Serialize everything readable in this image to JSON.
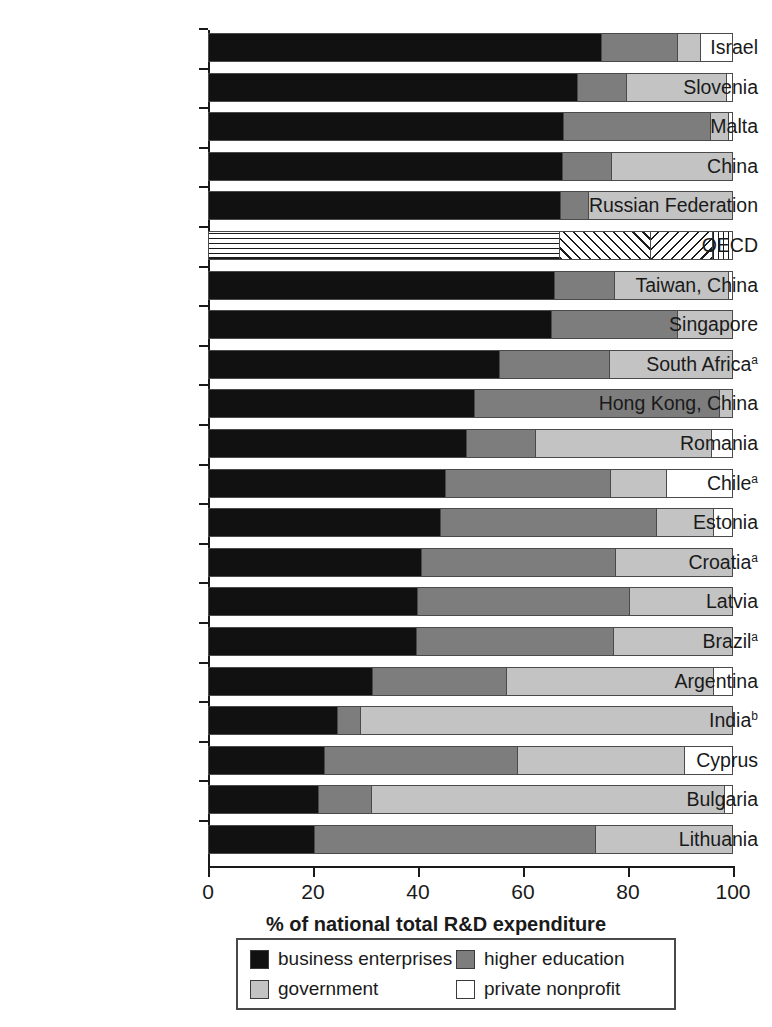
{
  "chart_data": {
    "type": "bar",
    "orientation": "horizontal",
    "stacked": true,
    "title": "",
    "xlabel": "% of national total R&D expenditure",
    "ylabel": "",
    "xlim": [
      0,
      100
    ],
    "xticks": [
      "0",
      "20",
      "40",
      "60",
      "80",
      "100"
    ],
    "grid": false,
    "legend_position": "bottom",
    "categories": [
      "Israel",
      "Slovenia",
      "Malta",
      "China",
      "Russian Federation",
      "OECD",
      "Taiwan, China",
      "Singapore",
      "South Africa",
      "Hong Kong, China",
      "Romania",
      "Chile",
      "Estonia",
      "Croatia",
      "Latvia",
      "Brazil",
      "Argentina",
      "India",
      "Cyprus",
      "Bulgaria",
      "Lithuania"
    ],
    "category_footnotes": [
      "",
      "",
      "",
      "",
      "",
      "",
      "",
      "",
      "a",
      "",
      "",
      "a",
      "",
      "a",
      "",
      "a",
      "",
      "b",
      "",
      "",
      ""
    ],
    "series": [
      {
        "name": "business enterprises",
        "color": "#111111",
        "values": [
          75.0,
          70.3,
          67.7,
          67.5,
          67.2,
          66.9,
          65.9,
          65.4,
          55.4,
          50.7,
          49.1,
          45.2,
          44.2,
          40.6,
          39.8,
          39.6,
          31.1,
          24.4,
          21.9,
          20.8,
          20.0
        ]
      },
      {
        "name": "higher education",
        "color": "#7d7d7d",
        "values": [
          14.4,
          9.4,
          28.0,
          9.3,
          5.2,
          17.4,
          11.5,
          24.0,
          21.0,
          46.9,
          13.3,
          31.4,
          41.2,
          37.0,
          40.6,
          37.6,
          25.6,
          4.4,
          37.0,
          10.1,
          53.8
        ]
      },
      {
        "name": "government",
        "color": "#c3c3c3",
        "values": [
          4.4,
          19.2,
          3.5,
          23.2,
          27.6,
          11.9,
          21.8,
          10.6,
          23.6,
          2.4,
          33.6,
          10.7,
          11.0,
          22.4,
          19.6,
          22.8,
          39.6,
          71.2,
          32.0,
          67.6,
          26.2
        ]
      },
      {
        "name": "private nonprofit",
        "color": "#ffffff",
        "values": [
          6.2,
          1.1,
          0.8,
          0.0,
          0.0,
          3.8,
          0.8,
          0.0,
          0.0,
          0.0,
          4.0,
          12.7,
          3.6,
          0.0,
          0.0,
          0.0,
          3.7,
          0.0,
          9.1,
          1.5,
          0.0
        ]
      }
    ],
    "hatched_rows": [
      5
    ]
  },
  "legend": {
    "items": [
      {
        "label": "business enterprises",
        "swatch": "sw-business"
      },
      {
        "label": "higher education",
        "swatch": "sw-higher"
      },
      {
        "label": "government",
        "swatch": "sw-government"
      },
      {
        "label": "private nonprofit",
        "swatch": "sw-nonprofit"
      }
    ]
  }
}
